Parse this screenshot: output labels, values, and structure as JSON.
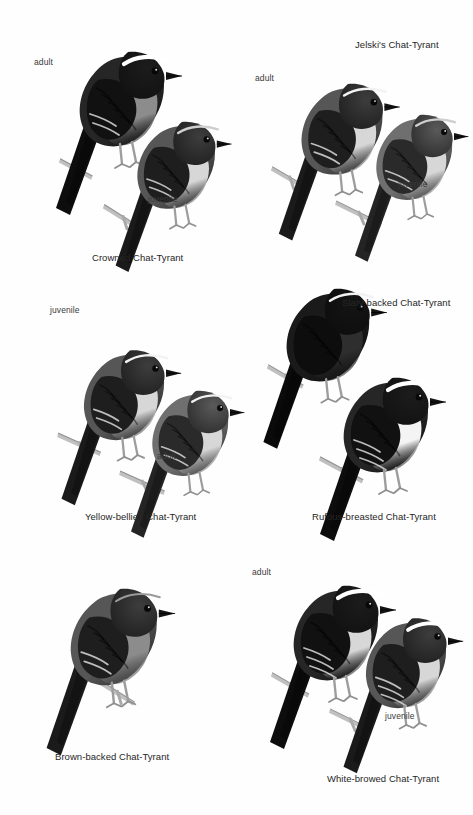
{
  "plate": {
    "kind": "field-guide-illustration-plate",
    "palette": {
      "background": "#fefefe",
      "label_text": "#3a3a3a",
      "species_text": "#262626",
      "dark_plumage": "#1d1d1d",
      "mid_plumage": "#5e5e5e",
      "light_plumage": "#c9c9c9",
      "pale_underpart": "#e8e8e8",
      "white_brow": "#ffffff",
      "perch_gray": "#b9b9b9"
    },
    "panels": [
      {
        "id": "crowned",
        "species_label": "Crowned Chat-Tyrant",
        "species_label_pos": {
          "x": 92,
          "y": 253
        },
        "birds": [
          {
            "name": "crowned-adult",
            "age_label": "adult",
            "age_label_pos": {
              "x": 34,
              "y": 58
            },
            "pos": {
              "x": 36,
              "y": 22
            },
            "size": 1.0,
            "tone": "dark",
            "brow": "bold-white",
            "belly": "mid",
            "wingbars": 2
          },
          {
            "name": "crowned-juvenile",
            "age_label": "juvenile",
            "age_label_pos": {
              "x": 148,
              "y": 195
            },
            "pos": {
              "x": 90,
              "y": 88
            },
            "size": 0.92,
            "tone": "mid",
            "brow": "buff",
            "belly": "pale",
            "wingbars": 2
          }
        ],
        "perches": [
          {
            "x": 60,
            "y": 150,
            "len": 36,
            "angle": 18
          },
          {
            "x": 104,
            "y": 196,
            "len": 44,
            "angle": 22
          }
        ]
      },
      {
        "id": "jelskis",
        "species_label": "Jelski's Chat-Tyrant",
        "species_label_pos": {
          "x": 355,
          "y": 40
        },
        "birds": [
          {
            "name": "jelskis-adult",
            "age_label": "adult",
            "age_label_pos": {
              "x": 255,
              "y": 74
            },
            "pos": {
              "x": 256,
              "y": 52
            },
            "size": 0.96,
            "tone": "mid",
            "brow": "thin-white",
            "belly": "pale",
            "wingbars": 2
          },
          {
            "name": "jelskis-juvenile",
            "age_label": "juvenile",
            "age_label_pos": {
              "x": 398,
              "y": 180
            },
            "pos": {
              "x": 328,
              "y": 80
            },
            "size": 0.9,
            "tone": "light",
            "brow": "buff",
            "belly": "pale",
            "wingbars": 2
          }
        ],
        "perches": [
          {
            "x": 272,
            "y": 158,
            "len": 40,
            "angle": 20
          },
          {
            "x": 336,
            "y": 192,
            "len": 50,
            "angle": 16
          }
        ]
      },
      {
        "id": "yellow-bellied",
        "species_label": "Yellow-bellied Chat-Tyrant",
        "species_label_pos": {
          "x": 85,
          "y": 512
        },
        "birds": [
          {
            "name": "yellow-bellied-juvenile",
            "age_label": "juvenile",
            "age_label_pos": {
              "x": 50,
              "y": 306
            },
            "pos": {
              "x": 38,
              "y": 318
            },
            "size": 0.95,
            "tone": "mid",
            "brow": "thin-white",
            "belly": "pale",
            "wingbars": 2
          },
          {
            "name": "yellow-bellied-adult",
            "age_label": "adult",
            "age_label_pos": {
              "x": 157,
              "y": 452
            },
            "pos": {
              "x": 104,
              "y": 356
            },
            "size": 0.9,
            "tone": "light",
            "brow": "thin-white",
            "belly": "pale",
            "wingbars": 2
          }
        ],
        "perches": [
          {
            "x": 58,
            "y": 424,
            "len": 46,
            "angle": 14
          },
          {
            "x": 120,
            "y": 462,
            "len": 48,
            "angle": 14
          }
        ]
      },
      {
        "id": "slaty-backed",
        "species_label": "Slaty-backed Chat-Tyrant",
        "species_label_pos": {
          "x": 342,
          "y": 298
        },
        "birds": [
          {
            "name": "slaty-backed-bird",
            "age_label": null,
            "age_label_pos": null,
            "pos": {
              "x": 242,
              "y": 258
            },
            "size": 0.98,
            "tone": "darkest",
            "brow": "thin-white",
            "belly": "dark",
            "wingbars": 0
          }
        ],
        "perches": [
          {
            "x": 268,
            "y": 356,
            "len": 40,
            "angle": 20
          }
        ]
      },
      {
        "id": "rufous-breasted",
        "species_label": "Rufous-breasted Chat-Tyrant",
        "species_label_pos": {
          "x": 312,
          "y": 512
        },
        "birds": [
          {
            "name": "rufous-breasted-bird",
            "age_label": null,
            "age_label_pos": null,
            "pos": {
              "x": 300,
              "y": 348
            },
            "size": 1.0,
            "tone": "dark",
            "brow": "bold-white",
            "belly": "white",
            "wingbars": 3
          }
        ],
        "perches": [
          {
            "x": 320,
            "y": 448,
            "len": 48,
            "angle": 18
          }
        ]
      },
      {
        "id": "brown-backed",
        "species_label": "Brown-backed Chat-Tyrant",
        "species_label_pos": {
          "x": 55,
          "y": 752
        },
        "birds": [
          {
            "name": "brown-backed-bird",
            "age_label": null,
            "age_label_pos": null,
            "pos": {
              "x": 28,
              "y": 560
            },
            "size": 1.02,
            "tone": "mid",
            "brow": "faint",
            "belly": "mid",
            "wingbars": 2
          }
        ],
        "perches": [
          {
            "x": 100,
            "y": 672,
            "len": 40,
            "angle": 22
          }
        ]
      },
      {
        "id": "white-browed",
        "species_label": "White-browed Chat-Tyrant",
        "species_label_pos": {
          "x": 327,
          "y": 774
        },
        "birds": [
          {
            "name": "white-browed-adult",
            "age_label": "adult",
            "age_label_pos": {
              "x": 252,
              "y": 568
            },
            "pos": {
              "x": 250,
              "y": 556
            },
            "size": 1.0,
            "tone": "dark",
            "brow": "bold-white",
            "belly": "pale",
            "wingbars": 3
          },
          {
            "name": "white-browed-juvenile",
            "age_label": "juvenile",
            "age_label_pos": {
              "x": 385,
              "y": 712
            },
            "pos": {
              "x": 320,
              "y": 586
            },
            "size": 0.95,
            "tone": "mid",
            "brow": "bold-white",
            "belly": "pale",
            "wingbars": 3
          }
        ],
        "perches": [
          {
            "x": 272,
            "y": 664,
            "len": 42,
            "angle": 20
          },
          {
            "x": 330,
            "y": 700,
            "len": 44,
            "angle": 16
          }
        ]
      }
    ]
  }
}
